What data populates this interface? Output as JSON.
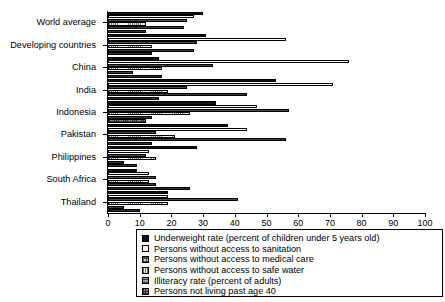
{
  "chart_data": {
    "type": "bar",
    "orientation": "horizontal",
    "title": "",
    "xlabel": "",
    "ylabel": "",
    "xlim": [
      0,
      100
    ],
    "xticks": [
      0,
      10,
      20,
      30,
      40,
      50,
      60,
      70,
      80,
      90,
      100
    ],
    "grid": false,
    "legend_position": "below",
    "categories": [
      "World average",
      "Developing countries",
      "China",
      "India",
      "Indonesia",
      "Pakistan",
      "Philippines",
      "South Africa",
      "Thailand"
    ],
    "series": [
      {
        "name": "Underweight rate (percent of children under 5 years old)",
        "style": "solid-black",
        "values": [
          30,
          31,
          16,
          53,
          34,
          38,
          28,
          9,
          19
        ]
      },
      {
        "name": "Persons without access to sanitation",
        "style": "open-white",
        "values": [
          27,
          56,
          76,
          71,
          47,
          44,
          13,
          13,
          19
        ]
      },
      {
        "name": "Persons without access to medical care",
        "style": "cross-hatch",
        "values": [
          25,
          28,
          33,
          25,
          57,
          15,
          12,
          15,
          41
        ]
      },
      {
        "name": "Persons without access to safe water",
        "style": "fine-dots",
        "values": [
          12,
          14,
          17,
          19,
          26,
          21,
          15,
          13,
          19
        ]
      },
      {
        "name": "Illiteracy rate (percent of adults)",
        "style": "horizontal-lines",
        "values": [
          24,
          27,
          8,
          44,
          14,
          56,
          5,
          15,
          5
        ]
      },
      {
        "name": "Persons not living past age 40",
        "style": "dark-mesh",
        "values": [
          12,
          14,
          17,
          16,
          12,
          14,
          9,
          26,
          10
        ]
      }
    ]
  },
  "legend": {
    "items": [
      "Underweight rate (percent of children under 5 years old)",
      "Persons without access to sanitation",
      "Persons without access to medical care",
      "Persons without access to safe water",
      "Illiteracy rate (percent of adults)",
      "Persons not living past age 40"
    ]
  }
}
